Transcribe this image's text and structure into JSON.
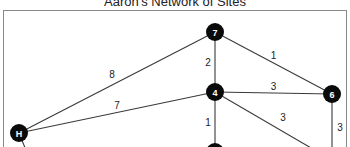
{
  "title": "Aaron's Network of Sites",
  "nodes": [
    {
      "id": "7",
      "label": "7"
    },
    {
      "id": "4",
      "label": "4"
    },
    {
      "id": "6",
      "label": "6"
    },
    {
      "id": "H",
      "label": "H"
    },
    {
      "id": "B",
      "label": ""
    }
  ],
  "edges": [
    {
      "from": "7",
      "to": "4",
      "weight": "2"
    },
    {
      "from": "7",
      "to": "6",
      "weight": "1"
    },
    {
      "from": "7",
      "to": "H",
      "weight": "8"
    },
    {
      "from": "4",
      "to": "6",
      "weight": "3"
    },
    {
      "from": "4",
      "to": "H",
      "weight": "7"
    },
    {
      "from": "4",
      "to": "B",
      "weight": "1"
    },
    {
      "from": "4",
      "to": "offscreen-right",
      "weight": "3"
    },
    {
      "from": "6",
      "to": "offscreen-bottom",
      "weight": "3"
    },
    {
      "from": "H",
      "to": "offscreen-bottom-left",
      "weight": ""
    }
  ]
}
